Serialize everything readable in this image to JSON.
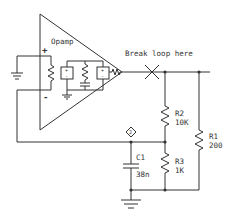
{
  "diagram": {
    "type": "circuit-schematic",
    "opamp": {
      "label": "Opamp",
      "plus": "+",
      "minus": "-"
    },
    "break_label": "Break loop here",
    "probe_label": "2",
    "components": [
      {
        "ref": "R2",
        "value": "10K"
      },
      {
        "ref": "R1",
        "value": "200"
      },
      {
        "ref": "C1",
        "value": "38n"
      },
      {
        "ref": "R3",
        "value": "1K"
      }
    ],
    "stroke_color": "#333333"
  }
}
